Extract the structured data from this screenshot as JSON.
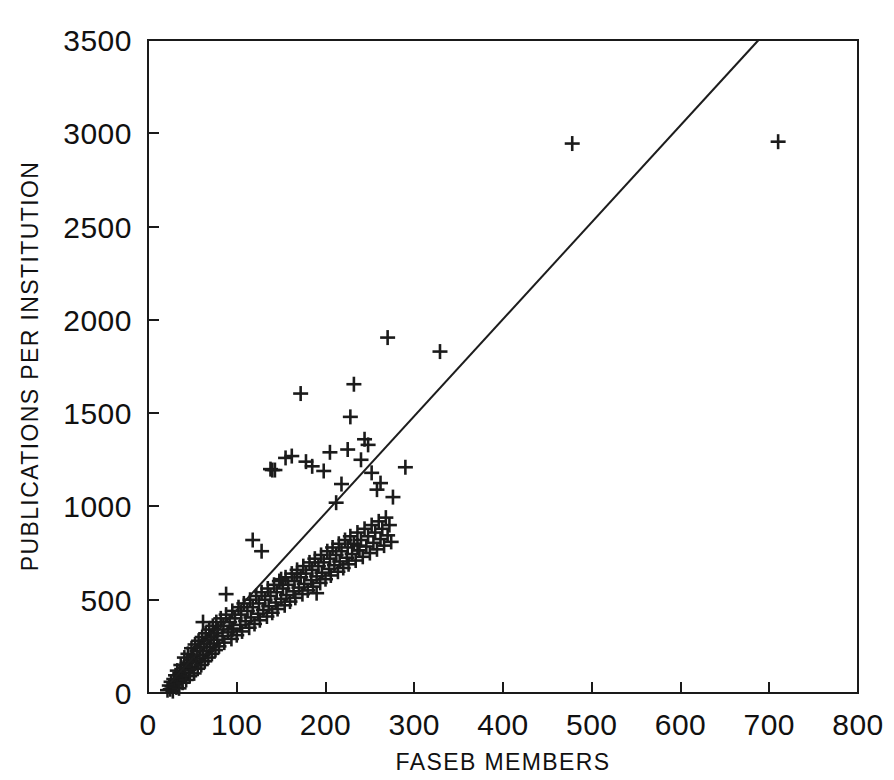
{
  "figure": {
    "background_color": "#ffffff",
    "ink_color": "#1a1a1a",
    "title": "",
    "caption": ""
  },
  "axes": {
    "x_title": "FASEB MEMBERS",
    "y_title": "PUBLICATIONS PER INSTITUTION",
    "x_ticks": [
      "0",
      "100",
      "200",
      "300",
      "400",
      "500",
      "600",
      "700",
      "800"
    ],
    "y_ticks": [
      "0",
      "500",
      "1000",
      "1500",
      "2000",
      "2500",
      "3000",
      "3500"
    ],
    "frame": "box"
  },
  "chart_data": {
    "type": "scatter",
    "title": "",
    "xlabel": "FASEB MEMBERS",
    "ylabel": "PUBLICATIONS PER INSTITUTION",
    "xlim": [
      0,
      800
    ],
    "ylim": [
      0,
      3500
    ],
    "xticks": [
      0,
      100,
      200,
      300,
      400,
      500,
      600,
      700,
      800
    ],
    "yticks": [
      0,
      500,
      1000,
      1500,
      2000,
      2500,
      3000,
      3500
    ],
    "grid": false,
    "legend": null,
    "marker": "plus",
    "marker_color": "#1b1b1b",
    "series": [
      {
        "name": "Institutions",
        "points": [
          [
            22,
            15
          ],
          [
            24,
            40
          ],
          [
            25,
            20
          ],
          [
            26,
            60
          ],
          [
            27,
            35
          ],
          [
            28,
            10
          ],
          [
            29,
            75
          ],
          [
            30,
            45
          ],
          [
            31,
            95
          ],
          [
            32,
            30
          ],
          [
            33,
            120
          ],
          [
            34,
            65
          ],
          [
            35,
            25
          ],
          [
            36,
            105
          ],
          [
            37,
            150
          ],
          [
            38,
            80
          ],
          [
            39,
            55
          ],
          [
            40,
            135
          ],
          [
            41,
            190
          ],
          [
            42,
            110
          ],
          [
            43,
            70
          ],
          [
            44,
            160
          ],
          [
            45,
            210
          ],
          [
            46,
            125
          ],
          [
            47,
            90
          ],
          [
            48,
            175
          ],
          [
            49,
            240
          ],
          [
            50,
            140
          ],
          [
            51,
            200
          ],
          [
            52,
            105
          ],
          [
            53,
            260
          ],
          [
            54,
            165
          ],
          [
            55,
            225
          ],
          [
            56,
            130
          ],
          [
            57,
            280
          ],
          [
            58,
            185
          ],
          [
            59,
            245
          ],
          [
            60,
            150
          ],
          [
            61,
            300
          ],
          [
            62,
            205
          ],
          [
            63,
            265
          ],
          [
            64,
            170
          ],
          [
            65,
            320
          ],
          [
            66,
            225
          ],
          [
            67,
            285
          ],
          [
            68,
            190
          ],
          [
            69,
            340
          ],
          [
            70,
            245
          ],
          [
            71,
            300
          ],
          [
            72,
            210
          ],
          [
            73,
            360
          ],
          [
            74,
            265
          ],
          [
            75,
            320
          ],
          [
            76,
            230
          ],
          [
            77,
            380
          ],
          [
            78,
            285
          ],
          [
            79,
            340
          ],
          [
            80,
            250
          ],
          [
            82,
            400
          ],
          [
            84,
            305
          ],
          [
            85,
            360
          ],
          [
            86,
            270
          ],
          [
            88,
            420
          ],
          [
            90,
            325
          ],
          [
            92,
            380
          ],
          [
            94,
            290
          ],
          [
            95,
            440
          ],
          [
            96,
            345
          ],
          [
            98,
            400
          ],
          [
            100,
            310
          ],
          [
            102,
            460
          ],
          [
            104,
            365
          ],
          [
            105,
            420
          ],
          [
            106,
            330
          ],
          [
            108,
            480
          ],
          [
            110,
            385
          ],
          [
            112,
            440
          ],
          [
            114,
            350
          ],
          [
            115,
            500
          ],
          [
            116,
            405
          ],
          [
            118,
            460
          ],
          [
            120,
            370
          ],
          [
            122,
            520
          ],
          [
            124,
            425
          ],
          [
            125,
            480
          ],
          [
            126,
            390
          ],
          [
            128,
            540
          ],
          [
            130,
            445
          ],
          [
            132,
            500
          ],
          [
            134,
            410
          ],
          [
            135,
            560
          ],
          [
            136,
            465
          ],
          [
            138,
            520
          ],
          [
            140,
            430
          ],
          [
            142,
            580
          ],
          [
            144,
            485
          ],
          [
            145,
            540
          ],
          [
            146,
            450
          ],
          [
            148,
            600
          ],
          [
            150,
            505
          ],
          [
            152,
            560
          ],
          [
            154,
            470
          ],
          [
            155,
            620
          ],
          [
            156,
            525
          ],
          [
            158,
            580
          ],
          [
            160,
            490
          ],
          [
            162,
            640
          ],
          [
            164,
            545
          ],
          [
            165,
            600
          ],
          [
            166,
            510
          ],
          [
            168,
            660
          ],
          [
            170,
            565
          ],
          [
            172,
            620
          ],
          [
            174,
            530
          ],
          [
            175,
            680
          ],
          [
            176,
            585
          ],
          [
            178,
            640
          ],
          [
            180,
            550
          ],
          [
            182,
            700
          ],
          [
            184,
            605
          ],
          [
            185,
            660
          ],
          [
            186,
            570
          ],
          [
            188,
            720
          ],
          [
            190,
            625
          ],
          [
            192,
            680
          ],
          [
            194,
            590
          ],
          [
            195,
            740
          ],
          [
            196,
            645
          ],
          [
            198,
            700
          ],
          [
            200,
            610
          ],
          [
            202,
            760
          ],
          [
            204,
            665
          ],
          [
            205,
            720
          ],
          [
            206,
            630
          ],
          [
            208,
            780
          ],
          [
            210,
            685
          ],
          [
            212,
            740
          ],
          [
            214,
            650
          ],
          [
            215,
            800
          ],
          [
            216,
            705
          ],
          [
            218,
            760
          ],
          [
            220,
            670
          ],
          [
            222,
            820
          ],
          [
            224,
            725
          ],
          [
            225,
            780
          ],
          [
            226,
            690
          ],
          [
            228,
            840
          ],
          [
            230,
            745
          ],
          [
            232,
            800
          ],
          [
            234,
            710
          ],
          [
            236,
            860
          ],
          [
            238,
            765
          ],
          [
            240,
            820
          ],
          [
            242,
            730
          ],
          [
            244,
            880
          ],
          [
            246,
            785
          ],
          [
            248,
            840
          ],
          [
            250,
            750
          ],
          [
            252,
            900
          ],
          [
            254,
            805
          ],
          [
            256,
            860
          ],
          [
            258,
            770
          ],
          [
            260,
            920
          ],
          [
            262,
            825
          ],
          [
            264,
            880
          ],
          [
            266,
            790
          ],
          [
            268,
            940
          ],
          [
            270,
            845
          ],
          [
            272,
            900
          ],
          [
            274,
            810
          ],
          [
            62,
            380
          ],
          [
            88,
            530
          ],
          [
            95,
            340
          ],
          [
            118,
            820
          ],
          [
            128,
            760
          ],
          [
            138,
            1200
          ],
          [
            140,
            1195
          ],
          [
            143,
            1195
          ],
          [
            150,
            610
          ],
          [
            155,
            1260
          ],
          [
            162,
            1270
          ],
          [
            168,
            640
          ],
          [
            172,
            1605
          ],
          [
            178,
            1240
          ],
          [
            185,
            1215
          ],
          [
            190,
            535
          ],
          [
            198,
            1190
          ],
          [
            205,
            1290
          ],
          [
            212,
            1020
          ],
          [
            218,
            1120
          ],
          [
            225,
            1305
          ],
          [
            228,
            1480
          ],
          [
            232,
            1655
          ],
          [
            236,
            790
          ],
          [
            238,
            765
          ],
          [
            240,
            1250
          ],
          [
            244,
            1360
          ],
          [
            248,
            1330
          ],
          [
            252,
            1180
          ],
          [
            258,
            1090
          ],
          [
            262,
            1125
          ],
          [
            270,
            1905
          ],
          [
            276,
            1050
          ],
          [
            290,
            1210
          ],
          [
            329,
            1830
          ],
          [
            478,
            2945
          ],
          [
            710,
            2955
          ]
        ]
      }
    ],
    "fit_line": {
      "type": "linear",
      "x_start": 25,
      "y_start": 55,
      "x_end": 688,
      "y_end": 3500,
      "slope": 5.2,
      "intercept": -75
    },
    "n_points": 205
  }
}
